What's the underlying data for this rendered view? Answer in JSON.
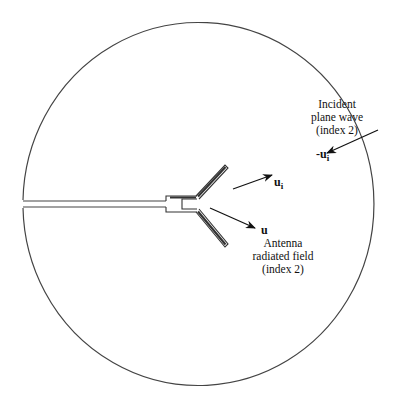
{
  "figure": {
    "type": "antenna-scattering-diagram",
    "boundary": "circle"
  },
  "labels": {
    "incident": {
      "line1": "Incident",
      "line2": "plane wave",
      "line3": "(index 2)"
    },
    "incident_vector": {
      "prefix": "-u",
      "sub": "i"
    },
    "ui_vector": {
      "base": "u",
      "sub": "i"
    },
    "u_vector": {
      "base": "u"
    },
    "radiated": {
      "line1": "Antenna",
      "line2": "radiated field",
      "line3": "(index 2)"
    }
  },
  "colors": {
    "stroke": "#333333",
    "background": "#ffffff"
  }
}
